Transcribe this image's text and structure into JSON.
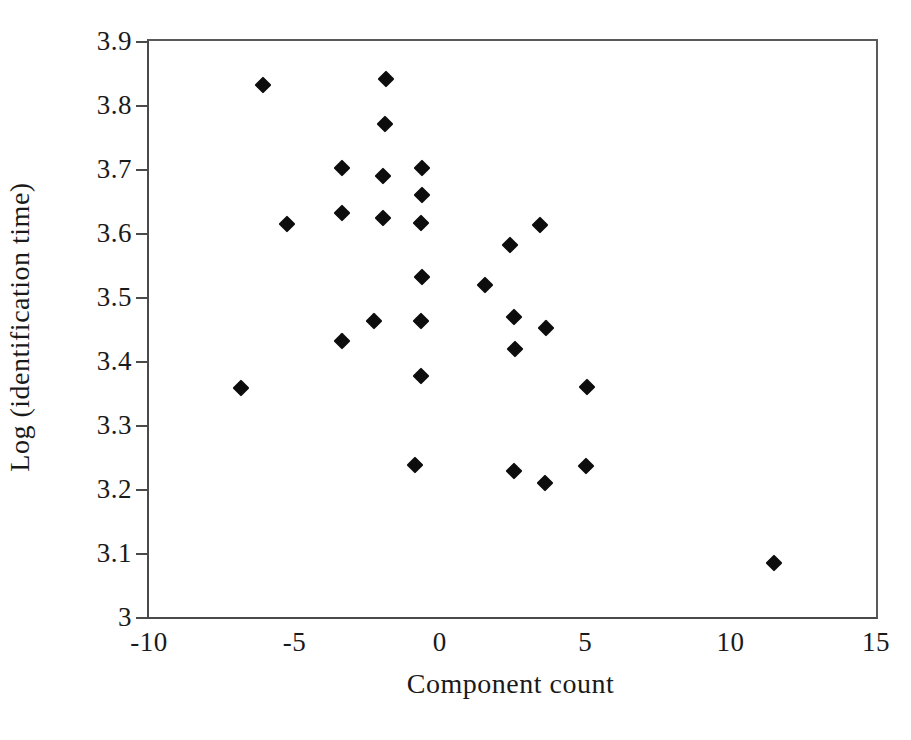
{
  "chart_data": {
    "type": "scatter",
    "title": "",
    "xlabel": "Component count",
    "ylabel": "Log (identification time)",
    "xlim": [
      -10,
      15
    ],
    "ylim": [
      3,
      3.9
    ],
    "grid": false,
    "legend": null,
    "marker": "filled-diamond",
    "marker_color": "#0d0d0d",
    "xticks": [
      "-10",
      "-5",
      "0",
      "5",
      "10",
      "15"
    ],
    "xtick_values": [
      -10,
      -5,
      0,
      5,
      10,
      15
    ],
    "yticks": [
      "3",
      "3.1",
      "3.2",
      "3.3",
      "3.4",
      "3.5",
      "3.6",
      "3.7",
      "3.8",
      "3.9"
    ],
    "ytick_values": [
      3,
      3.1,
      3.2,
      3.3,
      3.4,
      3.5,
      3.6,
      3.7,
      3.8,
      3.9
    ],
    "points": [
      {
        "x": -6.85,
        "y": 3.358
      },
      {
        "x": -6.08,
        "y": 3.831
      },
      {
        "x": -5.25,
        "y": 3.614
      },
      {
        "x": -3.38,
        "y": 3.702
      },
      {
        "x": -3.38,
        "y": 3.632
      },
      {
        "x": -3.38,
        "y": 3.432
      },
      {
        "x": -2.26,
        "y": 3.462
      },
      {
        "x": -1.85,
        "y": 3.84
      },
      {
        "x": -1.89,
        "y": 3.771
      },
      {
        "x": -1.94,
        "y": 3.689
      },
      {
        "x": -1.95,
        "y": 3.624
      },
      {
        "x": -0.62,
        "y": 3.701
      },
      {
        "x": -0.62,
        "y": 3.659
      },
      {
        "x": -0.64,
        "y": 3.616
      },
      {
        "x": -0.62,
        "y": 3.532
      },
      {
        "x": -0.65,
        "y": 3.462
      },
      {
        "x": -0.65,
        "y": 3.376
      },
      {
        "x": -0.86,
        "y": 3.237
      },
      {
        "x": 1.54,
        "y": 3.518
      },
      {
        "x": 2.42,
        "y": 3.581
      },
      {
        "x": 2.55,
        "y": 3.468
      },
      {
        "x": 2.57,
        "y": 3.418
      },
      {
        "x": 2.55,
        "y": 3.228
      },
      {
        "x": 3.45,
        "y": 3.613
      },
      {
        "x": 3.64,
        "y": 3.451
      },
      {
        "x": 3.61,
        "y": 3.21
      },
      {
        "x": 5.05,
        "y": 3.36
      },
      {
        "x": 5.03,
        "y": 3.236
      },
      {
        "x": 11.48,
        "y": 3.085
      }
    ]
  }
}
